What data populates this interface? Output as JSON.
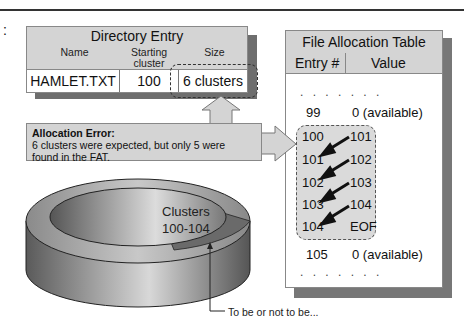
{
  "page": {
    "colon": ":"
  },
  "directory_entry": {
    "title": "Directory Entry",
    "headers": {
      "name": "Name",
      "starting_cluster_line1": "Starting",
      "starting_cluster_line2": "cluster",
      "size": "Size"
    },
    "row": {
      "name": "HAMLET.TXT",
      "starting_cluster": "100",
      "size": "6 clusters"
    }
  },
  "error": {
    "title": "Allocation Error:",
    "message_line1": "6 clusters were expected, but only 5 were",
    "message_line2": "found in the FAT."
  },
  "fat": {
    "title": "File Allocation Table",
    "headers": {
      "entry": "Entry #",
      "value": "Value"
    },
    "ellipsis": ". . . . . . .",
    "rows_before": [
      {
        "entry": "99",
        "value": "0 (available)"
      }
    ],
    "chain": [
      {
        "entry": "100",
        "value": "101"
      },
      {
        "entry": "101",
        "value": "102"
      },
      {
        "entry": "102",
        "value": "103"
      },
      {
        "entry": "103",
        "value": "104"
      },
      {
        "entry": "104",
        "value": "EOF"
      }
    ],
    "rows_after": [
      {
        "entry": "105",
        "value": "0 (available)"
      }
    ]
  },
  "disk": {
    "label_line1": "Clusters",
    "label_line2": "100-104",
    "caption": "To be or not to be..."
  },
  "colors": {
    "panel": "#d4d4d4",
    "shadow": "#6e6e6e",
    "chain_bg": "#dadada"
  }
}
